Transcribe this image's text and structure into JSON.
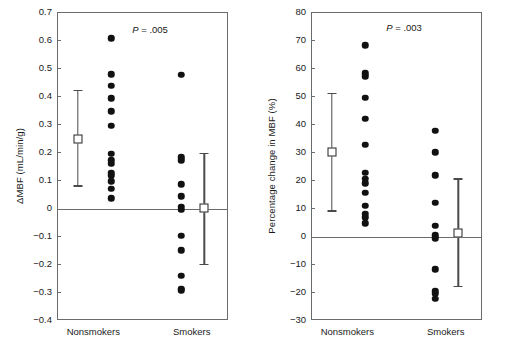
{
  "figure": {
    "panels": [
      {
        "id": "delta-mbf",
        "ytitle": "ΔMBF (mL/min/g)",
        "pvalue_text": "P = .005",
        "ylim": [
          -0.4,
          0.7
        ],
        "yticks": [
          "0.7",
          "0.6",
          "0.5",
          "0.4",
          "0.3",
          "0.2",
          "0.1",
          "0",
          "-0.1",
          "-0.2",
          "-0.3",
          "-0.4"
        ],
        "ytick_values": [
          0.7,
          0.6,
          0.5,
          0.4,
          0.3,
          0.2,
          0.1,
          0,
          -0.1,
          -0.2,
          -0.3,
          -0.4
        ],
        "groups": [
          {
            "label": "Nonsmokers",
            "values": [
              0.61,
              0.482,
              0.44,
              0.395,
              0.35,
              0.298,
              0.198,
              0.175,
              0.162,
              0.13,
              0.12,
              0.1,
              0.073,
              0.038
            ],
            "mean": 0.25,
            "lower": 0.08,
            "upper": 0.425
          },
          {
            "label": "Smokers",
            "values": [
              0.48,
              0.185,
              0.175,
              0.088,
              0.046,
              0.008,
              -0.002,
              -0.095,
              -0.148,
              -0.238,
              -0.285,
              -0.29
            ],
            "mean": 0.005,
            "lower": -0.2,
            "upper": 0.2
          }
        ]
      },
      {
        "id": "percentage-change-mbf",
        "ytitle": "Percentage change in MBF (%)",
        "pvalue_text": "P = .003",
        "ylim": [
          -30,
          80
        ],
        "yticks": [
          "80",
          "70",
          "60",
          "50",
          "40",
          "30",
          "20",
          "10",
          "0",
          "-10",
          "-20",
          "-30"
        ],
        "ytick_values": [
          80,
          70,
          60,
          50,
          40,
          30,
          20,
          10,
          0,
          -10,
          -20,
          -30
        ],
        "groups": [
          {
            "label": "Nonsmokers",
            "values": [
              68.5,
              58.5,
              57.5,
              49.8,
              42.2,
              33.0,
              23.0,
              20.8,
              19.2,
              15.8,
              11.2,
              8.3,
              7.0,
              5.0
            ],
            "mean": 30.2,
            "lower": 9.0,
            "upper": 51.5
          },
          {
            "label": "Smokers",
            "values": [
              38.0,
              30.3,
              22.0,
              12.3,
              4.0,
              0.6,
              -0.4,
              -11.5,
              -19.3,
              -20.3,
              -22.0
            ],
            "mean": 1.4,
            "lower": -18.0,
            "upper": 21.0
          }
        ]
      }
    ],
    "chart_data": {
      "type": "scatter",
      "title": "",
      "panels": [
        {
          "title": "",
          "ylabel": "ΔMBF (mL/min/g)",
          "xlabel": "",
          "ylim": [
            -0.4,
            0.7
          ],
          "ytick_values": [
            0.7,
            0.6,
            0.5,
            0.4,
            0.3,
            0.2,
            0.1,
            0,
            -0.1,
            -0.2,
            -0.3,
            -0.4
          ],
          "categories": [
            "Nonsmokers",
            "Smokers"
          ],
          "grid": false,
          "zero_reference_line": 0,
          "annotations": [
            "P = .005"
          ],
          "series": [
            {
              "name": "Nonsmokers",
              "values": [
                0.61,
                0.482,
                0.44,
                0.395,
                0.35,
                0.298,
                0.198,
                0.175,
                0.162,
                0.13,
                0.12,
                0.1,
                0.073,
                0.038
              ],
              "mean": 0.25,
              "error_low": 0.08,
              "error_high": 0.425
            },
            {
              "name": "Smokers",
              "values": [
                0.48,
                0.185,
                0.175,
                0.088,
                0.046,
                0.008,
                -0.002,
                -0.095,
                -0.148,
                -0.238,
                -0.285,
                -0.29
              ],
              "mean": 0.005,
              "error_low": -0.2,
              "error_high": 0.2
            }
          ]
        },
        {
          "title": "",
          "ylabel": "Percentage change in MBF (%)",
          "xlabel": "",
          "ylim": [
            -30,
            80
          ],
          "ytick_values": [
            80,
            70,
            60,
            50,
            40,
            30,
            20,
            10,
            0,
            -10,
            -20,
            -30
          ],
          "categories": [
            "Nonsmokers",
            "Smokers"
          ],
          "grid": false,
          "zero_reference_line": 0,
          "annotations": [
            "P = .003"
          ],
          "series": [
            {
              "name": "Nonsmokers",
              "values": [
                68.5,
                58.5,
                57.5,
                49.8,
                42.2,
                33.0,
                23.0,
                20.8,
                19.2,
                15.8,
                11.2,
                8.3,
                7.0,
                5.0
              ],
              "mean": 30.2,
              "error_low": 9.0,
              "error_high": 51.5
            },
            {
              "name": "Smokers",
              "values": [
                38.0,
                30.3,
                22.0,
                12.3,
                4.0,
                0.6,
                -0.4,
                -11.5,
                -19.3,
                -20.3,
                -22.0
              ],
              "mean": 1.4,
              "error_low": -18.0,
              "error_high": 21.0
            }
          ]
        }
      ]
    }
  }
}
